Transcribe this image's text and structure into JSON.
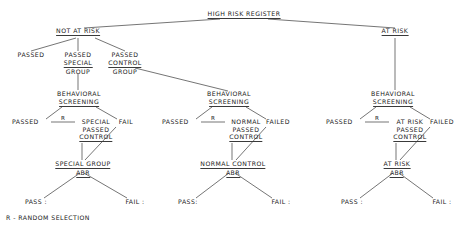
{
  "diagram": {
    "title": "HIGH RISK REGISTER",
    "legend": "R - RANDOM SELECTION",
    "root": {
      "label": "HIGH RISK REGISTER"
    },
    "branches": {
      "not_at_risk": {
        "label": "NOT AT RISK",
        "children": [
          {
            "label": "PASSED"
          },
          {
            "line1": "PASSED",
            "line2": "SPECIAL",
            "line3": "GROUP"
          },
          {
            "line1": "PASSED",
            "line2": "CONTROL",
            "line3": "GROUP"
          }
        ]
      },
      "at_risk": {
        "label": "AT RISK"
      }
    },
    "screenings": [
      {
        "id": "special",
        "line1": "BEHAVIORAL",
        "line2": "SCREENING",
        "pass_label": "PASSED",
        "random_mark": "R",
        "pass_result_line1": "SPECIAL",
        "pass_result_line2": "PASSED",
        "pass_result_line3": "CONTROL",
        "fail_label": "FAIL",
        "outcome_line1": "SPECIAL GROUP",
        "outcome_line2": "ABR",
        "outcome_pass": "PASS :",
        "outcome_fail": "FAIL :"
      },
      {
        "id": "normal",
        "line1": "BEHAVIORAL",
        "line2": "SCREENING",
        "pass_label": "PASSED",
        "random_mark": "R",
        "pass_result_line1": "NORMAL",
        "pass_result_line2": "PASSED",
        "pass_result_line3": "CONTROL",
        "fail_label": "FAILED",
        "outcome_line1": "NORMAL  CONTROL",
        "outcome_line2": "ABR",
        "outcome_pass": "PASS:",
        "outcome_fail": "FAIL :"
      },
      {
        "id": "atrisk",
        "line1": "BEHAVIORAL",
        "line2": "SCREENING",
        "pass_label": "PASSED",
        "random_mark": "R",
        "pass_result_line1": "AT RISK",
        "pass_result_line2": "PASSED",
        "pass_result_line3": "CONTROL",
        "fail_label": "FAILED",
        "outcome_line1": "AT RISK",
        "outcome_line2": "ABR",
        "outcome_pass": "PASS :",
        "outcome_fail": "FAIL :"
      }
    ],
    "colors": {
      "ink": "#1a1a1a",
      "line": "#3a3a3a",
      "background": "#ffffff"
    }
  }
}
